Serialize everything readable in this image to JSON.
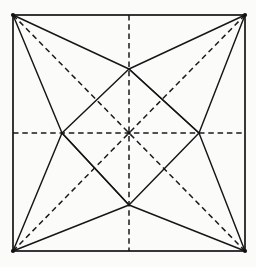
{
  "figure": {
    "background_color": "#fbfbfa",
    "ink_color": "#141414",
    "canvas": {
      "width": 256,
      "height": 267
    },
    "square": {
      "label": "outer-square",
      "left": 13,
      "top": 15,
      "right": 245,
      "bottom": 251,
      "stroke_width": 1.7,
      "style": "solid"
    },
    "points": {
      "corner_top_left": {
        "name": "A",
        "x": 13,
        "y": 15
      },
      "corner_top_right": {
        "name": "B",
        "x": 245,
        "y": 15
      },
      "corner_bottom_right": {
        "name": "C",
        "x": 245,
        "y": 251
      },
      "corner_bottom_left": {
        "name": "D",
        "x": 13,
        "y": 251
      },
      "midpoint_top": {
        "name": "M-top",
        "x": 129,
        "y": 15
      },
      "midpoint_right": {
        "name": "M-right",
        "x": 245,
        "y": 133
      },
      "midpoint_bottom": {
        "name": "M-bottom",
        "x": 129,
        "y": 251
      },
      "midpoint_left": {
        "name": "M-left",
        "x": 13,
        "y": 133
      },
      "center": {
        "name": "O",
        "x": 129,
        "y": 133
      },
      "star_point_top": {
        "name": "S-top",
        "x": 129,
        "y": 69
      },
      "star_point_right": {
        "name": "S-right",
        "x": 199,
        "y": 133
      },
      "star_point_bottom": {
        "name": "S-bottom",
        "x": 129,
        "y": 205
      },
      "star_point_left": {
        "name": "S-left",
        "x": 62,
        "y": 133
      }
    },
    "dashed_lines": {
      "style": "dashed",
      "dash_pattern": "5.5 3.8",
      "stroke_width": 1.5,
      "segments": [
        {
          "name": "horizontal-axis",
          "x1": 13,
          "y1": 133,
          "x2": 245,
          "y2": 133
        },
        {
          "name": "vertical-axis",
          "x1": 129,
          "y1": 15,
          "x2": 129,
          "y2": 251
        },
        {
          "name": "diagonal-nw-se",
          "x1": 13,
          "y1": 15,
          "x2": 245,
          "y2": 251
        },
        {
          "name": "diagonal-ne-sw",
          "x1": 245,
          "y1": 15,
          "x2": 13,
          "y2": 251
        }
      ]
    },
    "solid_rays": {
      "style": "solid",
      "stroke_width": 1.45,
      "description": "Each corner joins the two midpoints of the non-adjacent edges, forming the inscribed four-pointed star.",
      "segments": [
        {
          "name": "tl-to-star-top",
          "x1": 13,
          "y1": 15,
          "x2": 129,
          "y2": 69
        },
        {
          "name": "tl-to-star-left",
          "x1": 13,
          "y1": 15,
          "x2": 62,
          "y2": 133
        },
        {
          "name": "tr-to-star-top",
          "x1": 245,
          "y1": 15,
          "x2": 129,
          "y2": 69
        },
        {
          "name": "tr-to-star-right",
          "x1": 245,
          "y1": 15,
          "x2": 199,
          "y2": 133
        },
        {
          "name": "br-to-star-bottom",
          "x1": 245,
          "y1": 251,
          "x2": 129,
          "y2": 205
        },
        {
          "name": "br-to-star-right",
          "x1": 245,
          "y1": 251,
          "x2": 199,
          "y2": 133
        },
        {
          "name": "bl-to-star-bottom",
          "x1": 13,
          "y1": 251,
          "x2": 129,
          "y2": 205
        },
        {
          "name": "bl-to-star-left",
          "x1": 13,
          "y1": 251,
          "x2": 62,
          "y2": 133
        },
        {
          "name": "star-top-to-left",
          "x1": 129,
          "y1": 69,
          "x2": 62,
          "y2": 133
        },
        {
          "name": "star-top-to-right",
          "x1": 129,
          "y1": 69,
          "x2": 199,
          "y2": 133
        },
        {
          "name": "star-bottom-to-left",
          "x1": 129,
          "y1": 205,
          "x2": 62,
          "y2": 133
        },
        {
          "name": "star-bottom-to-right",
          "x1": 129,
          "y1": 205,
          "x2": 199,
          "y2": 133
        },
        {
          "name": "star-left-through-center-se",
          "x1": 62,
          "y1": 133,
          "x2": 129,
          "y2": 205
        },
        {
          "name": "star-right-through-center-nw",
          "x1": 199,
          "y1": 133,
          "x2": 129,
          "y2": 69
        }
      ]
    }
  }
}
